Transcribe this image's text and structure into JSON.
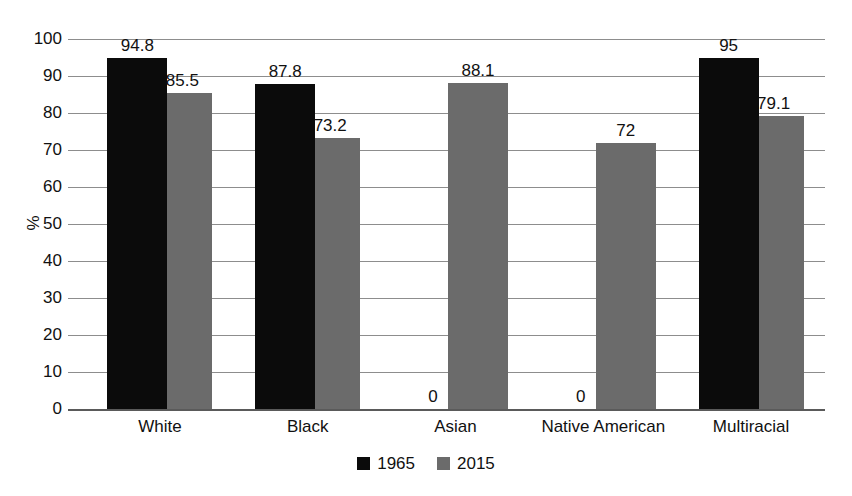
{
  "chart_data": {
    "type": "bar",
    "title": "",
    "subtitle": "",
    "xlabel": "",
    "ylabel": "%",
    "ylim": [
      0,
      100
    ],
    "ytick_step": 10,
    "yticks": [
      100,
      90,
      80,
      70,
      60,
      50,
      40,
      30,
      20,
      10,
      0
    ],
    "grid": true,
    "legend_position": "bottom-center",
    "categories": [
      "White",
      "Black",
      "Asian",
      "Native American",
      "Multiracial"
    ],
    "series": [
      {
        "name": "1965",
        "color": "#0b0b0b",
        "values": [
          94.8,
          87.8,
          0,
          0,
          95
        ],
        "labels": [
          "94.8",
          "87.8",
          "0",
          "0",
          "95"
        ]
      },
      {
        "name": "2015",
        "color": "#6b6b6b",
        "values": [
          85.5,
          73.2,
          88.1,
          72,
          79.1
        ],
        "labels": [
          "85.5",
          "73.2",
          "88.1",
          "72",
          "79.1"
        ]
      }
    ]
  },
  "axis": {
    "y_title": "%",
    "tick_labels": [
      "100",
      "90",
      "80",
      "70",
      "60",
      "50",
      "40",
      "30",
      "20",
      "10",
      "0"
    ]
  },
  "legend": {
    "items": [
      {
        "label": "1965",
        "color": "#0b0b0b"
      },
      {
        "label": "2015",
        "color": "#6b6b6b"
      }
    ]
  },
  "colors": {
    "series_1965": "#0b0b0b",
    "series_2015": "#6b6b6b",
    "gridline": "#8d8d8d",
    "axis": "#5a5a5a",
    "text": "#111111",
    "background": "#ffffff"
  }
}
